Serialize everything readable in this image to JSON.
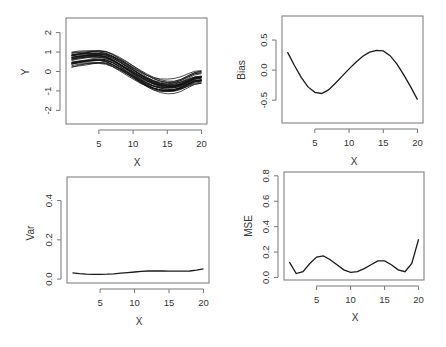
{
  "chart_data": [
    {
      "panel": "top-left",
      "type": "line",
      "title": "",
      "xlabel": "X",
      "ylabel": "Y",
      "xlim": [
        0.2,
        20.8
      ],
      "ylim": [
        -2.7,
        2.75
      ],
      "xticks": [
        5,
        10,
        15,
        20
      ],
      "yticks": [
        -2,
        -1,
        0,
        1,
        2
      ],
      "grid": false,
      "legend": null,
      "description": "Many overlaid simulated curves (approx. 30 realizations) following a sine-like shape",
      "x": [
        1,
        2,
        3,
        4,
        5,
        6,
        7,
        8,
        9,
        10,
        11,
        12,
        13,
        14,
        15,
        16,
        17,
        18,
        19,
        20
      ],
      "mean_curve": [
        0.62,
        0.68,
        0.72,
        0.76,
        0.78,
        0.74,
        0.6,
        0.4,
        0.18,
        -0.05,
        -0.28,
        -0.48,
        -0.64,
        -0.74,
        -0.78,
        -0.76,
        -0.66,
        -0.5,
        -0.35,
        -0.3
      ],
      "band_halfwidth": 0.32
    },
    {
      "panel": "top-right",
      "type": "line",
      "title": "",
      "xlabel": "X",
      "ylabel": "Bias",
      "xlim": [
        0.2,
        20.8
      ],
      "ylim": [
        -0.88,
        0.9
      ],
      "xticks": [
        5,
        10,
        15,
        20
      ],
      "yticks": [
        -0.5,
        0.0,
        0.5
      ],
      "grid": false,
      "legend": null,
      "x": [
        1,
        2,
        3,
        4,
        5,
        6,
        7,
        8,
        9,
        10,
        11,
        12,
        13,
        14,
        15,
        16,
        17,
        18,
        19,
        20
      ],
      "values": [
        0.3,
        0.08,
        -0.12,
        -0.28,
        -0.37,
        -0.39,
        -0.33,
        -0.22,
        -0.1,
        0.02,
        0.13,
        0.23,
        0.3,
        0.33,
        0.32,
        0.24,
        0.1,
        -0.08,
        -0.28,
        -0.49
      ]
    },
    {
      "panel": "bottom-left",
      "type": "line",
      "title": "",
      "xlabel": "X",
      "ylabel": "Var",
      "xlim": [
        0.2,
        20.8
      ],
      "ylim": [
        -0.02,
        0.52
      ],
      "xticks": [
        5,
        10,
        15,
        20
      ],
      "yticks": [
        0.0,
        0.2,
        0.4
      ],
      "grid": false,
      "legend": null,
      "x": [
        1,
        2,
        3,
        4,
        5,
        6,
        7,
        8,
        9,
        10,
        11,
        12,
        13,
        14,
        15,
        16,
        17,
        18,
        19,
        20
      ],
      "values": [
        0.032,
        0.028,
        0.025,
        0.024,
        0.024,
        0.025,
        0.027,
        0.03,
        0.033,
        0.036,
        0.039,
        0.041,
        0.042,
        0.041,
        0.04,
        0.04,
        0.04,
        0.041,
        0.045,
        0.052
      ]
    },
    {
      "panel": "bottom-right",
      "type": "line",
      "title": "",
      "xlabel": "X",
      "ylabel": "MSE",
      "xlim": [
        0.2,
        20.8
      ],
      "ylim": [
        -0.02,
        0.83
      ],
      "xticks": [
        5,
        10,
        15,
        20
      ],
      "yticks": [
        0.0,
        0.2,
        0.4,
        0.6,
        0.8
      ],
      "grid": false,
      "legend": null,
      "x": [
        1,
        2,
        3,
        4,
        5,
        6,
        7,
        8,
        9,
        10,
        11,
        12,
        13,
        14,
        15,
        16,
        17,
        18,
        19,
        20
      ],
      "values": [
        0.12,
        0.03,
        0.045,
        0.11,
        0.16,
        0.17,
        0.14,
        0.1,
        0.06,
        0.04,
        0.045,
        0.07,
        0.1,
        0.13,
        0.13,
        0.1,
        0.06,
        0.045,
        0.11,
        0.3
      ]
    }
  ],
  "labels": {
    "p1": {
      "xlabel": "X",
      "ylabel": "Y",
      "xticks": [
        "5",
        "10",
        "15",
        "20"
      ],
      "yticks": [
        "-2",
        "-1",
        "0",
        "1",
        "2"
      ]
    },
    "p2": {
      "xlabel": "X",
      "ylabel": "Bias",
      "xticks": [
        "5",
        "10",
        "15",
        "20"
      ],
      "yticks": [
        "-0.5",
        "0.0",
        "0.5"
      ]
    },
    "p3": {
      "xlabel": "X",
      "ylabel": "Var",
      "xticks": [
        "5",
        "10",
        "15",
        "20"
      ],
      "yticks": [
        "0.0",
        "0.2",
        "0.4"
      ]
    },
    "p4": {
      "xlabel": "X",
      "ylabel": "MSE",
      "xticks": [
        "5",
        "10",
        "15",
        "20"
      ],
      "yticks": [
        "0.0",
        "0.2",
        "0.4",
        "0.6",
        "0.8"
      ]
    }
  },
  "colors": {
    "line": "#1a1a1a",
    "axis": "#777777",
    "text": "#333333"
  }
}
